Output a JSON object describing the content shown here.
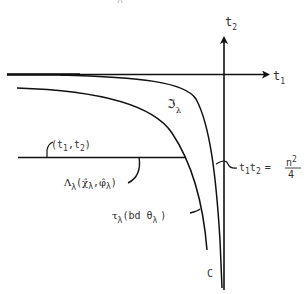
{
  "page_mark": "ʌ",
  "axes": {
    "horizontal_label": "t",
    "horizontal_sub": "1",
    "vertical_label": "t",
    "vertical_sub": "2"
  },
  "labels": {
    "curve_outer": {
      "main": "ℑ",
      "sub": "λ"
    },
    "point": {
      "text": "(t",
      "sub1": "1",
      "comma": ",t",
      "sub2": "2",
      "close": ")"
    },
    "lambda_set": {
      "main": "Λ",
      "sub": "λ",
      "open": "(",
      "chi": "χ̂",
      "chi_sub": "λ",
      "comma": ",",
      "phi": "φ̂",
      "phi_sub": "λ",
      "close": ")"
    },
    "tau": {
      "main": "τ",
      "sub": "λ",
      "body": "(bd θ",
      "theta_sub": "λ",
      "close": ")"
    },
    "hyperbola": {
      "t": "t",
      "s1": "1",
      "t2": "t",
      "s2": "2",
      "eq": "=",
      "num": "n",
      "exp": "2",
      "den": "4"
    },
    "c_point": "C"
  },
  "colors": {
    "ink": "#111111",
    "text": "#333333",
    "background": "#ffffff"
  }
}
